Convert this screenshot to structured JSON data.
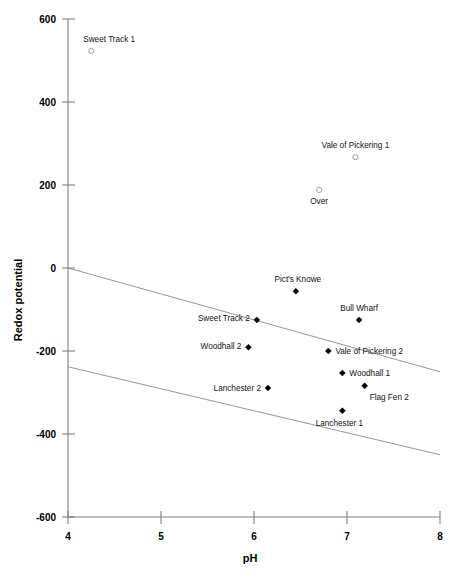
{
  "chart_data": {
    "type": "scatter",
    "title": "",
    "xlabel": "pH",
    "ylabel": "Redox potential",
    "xlim": [
      4,
      8
    ],
    "ylim": [
      -600,
      600
    ],
    "xticks": [
      "4",
      "5",
      "6",
      "7",
      "8"
    ],
    "yticks": [
      "600",
      "400",
      "200",
      "0",
      "-200",
      "-400",
      "-600"
    ],
    "grid": false,
    "legend": "none",
    "points": [
      {
        "label": "Sweet Track 1",
        "x": 4.25,
        "y": 523,
        "marker": "open-circle",
        "label_dx": -8,
        "label_dy": -9,
        "anchor": "start"
      },
      {
        "label": "Vale of Pickering 1",
        "x": 7.09,
        "y": 267,
        "marker": "open-circle",
        "label_dx": 0,
        "label_dy": -9,
        "anchor": "middle"
      },
      {
        "label": "Over",
        "x": 6.7,
        "y": 188,
        "marker": "open-circle",
        "label_dx": 0,
        "label_dy": 14,
        "anchor": "middle"
      },
      {
        "label": "Pict's Knowe",
        "x": 6.45,
        "y": -56,
        "marker": "filled-diamond",
        "label_dx": 2,
        "label_dy": -9,
        "anchor": "middle"
      },
      {
        "label": "Bull Wharf",
        "x": 7.13,
        "y": -125,
        "marker": "filled-diamond",
        "label_dx": 0,
        "label_dy": -9,
        "anchor": "middle"
      },
      {
        "label": "Sweet Track 2",
        "x": 6.03,
        "y": -125,
        "marker": "filled-diamond",
        "label_dx": -7,
        "label_dy": 1,
        "anchor": "end"
      },
      {
        "label": "Woodhall 2",
        "x": 5.94,
        "y": -191,
        "marker": "filled-diamond",
        "label_dx": -7,
        "label_dy": 2,
        "anchor": "end"
      },
      {
        "label": "Vale of Pickering 2",
        "x": 6.8,
        "y": -200,
        "marker": "filled-diamond",
        "label_dx": 7,
        "label_dy": 3,
        "anchor": "start"
      },
      {
        "label": "Woodhall 1",
        "x": 6.95,
        "y": -253,
        "marker": "filled-diamond",
        "label_dx": 7,
        "label_dy": 3,
        "anchor": "start"
      },
      {
        "label": "Flag Fen 2",
        "x": 7.19,
        "y": -284,
        "marker": "filled-diamond",
        "label_dx": 5,
        "label_dy": 14,
        "anchor": "start"
      },
      {
        "label": "Lanchester 2",
        "x": 6.15,
        "y": -289,
        "marker": "filled-diamond",
        "label_dx": -7,
        "label_dy": 3,
        "anchor": "end"
      },
      {
        "label": "Lanchester 1",
        "x": 6.95,
        "y": -344,
        "marker": "filled-diamond",
        "label_dx": -3,
        "label_dy": 15,
        "anchor": "middle"
      }
    ],
    "trend_lines": [
      {
        "name": "upper-bound-line",
        "x1": 4.0,
        "y1": 0,
        "x2": 8.0,
        "y2": -250
      },
      {
        "name": "lower-bound-line",
        "x1": 4.0,
        "y1": -238,
        "x2": 8.0,
        "y2": -450
      }
    ],
    "colors": {
      "axis": "#808080",
      "trend": "#8a8a8a",
      "marker_filled": "#000000",
      "marker_open": "#9a9a9a",
      "text": "#000000"
    }
  }
}
